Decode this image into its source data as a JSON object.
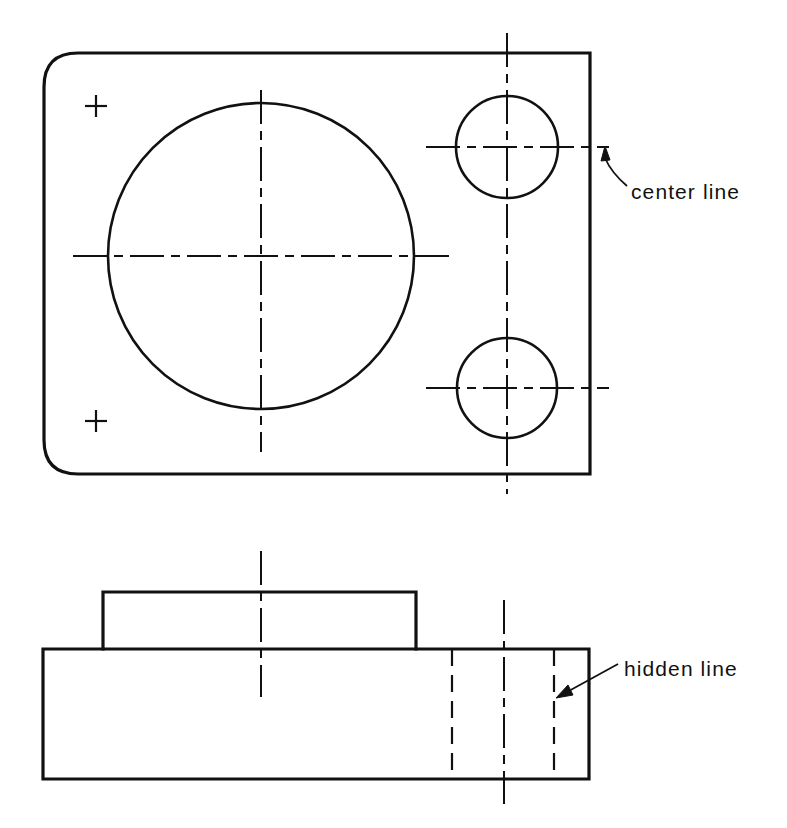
{
  "document": {
    "kind": "engineering-drawing",
    "background_color": "#ffffff",
    "line_color": "#111111"
  },
  "annotations": [
    {
      "id": "center-line",
      "label": "center  line",
      "text_x": 631,
      "text_y": 199,
      "leader": "M 627 186 C 620 180 611 172 605 158",
      "arrow_points": "605,146 601,161 610,160"
    },
    {
      "id": "hidden-line",
      "label": "hidden  line",
      "text_x": 624,
      "text_y": 676,
      "leader": "M 618 664 L 567 692",
      "arrow_points": "556,698 573,695 568,685"
    }
  ],
  "top_view": {
    "name": "top-view",
    "outline": {
      "left": 44,
      "top": 53,
      "right": 590,
      "bottom": 474,
      "corner_radius": 34,
      "rounded_corners": [
        "top-left",
        "bottom-left"
      ],
      "stroke_width": 3.2
    },
    "main_circle": {
      "cx": 261,
      "cy": 256,
      "r": 153,
      "stroke_width": 2.6
    },
    "holes": [
      {
        "id": "hole-top-right",
        "cx": 507,
        "cy": 147,
        "r": 51,
        "stroke_width": 2.6
      },
      {
        "id": "hole-bottom-right",
        "cx": 507,
        "cy": 388,
        "r": 50,
        "stroke_width": 2.6
      }
    ],
    "crosses": [
      {
        "id": "cross-top-left",
        "cx": 96,
        "cy": 106,
        "arm": 11
      },
      {
        "id": "cross-bottom-left",
        "cx": 96,
        "cy": 421,
        "arm": 11
      }
    ],
    "center_lines": [
      {
        "id": "main-circle-vertical",
        "x1": 261,
        "y1": 90,
        "x2": 261,
        "y2": 452
      },
      {
        "id": "main-circle-horizontal",
        "x1": 73,
        "y1": 256,
        "x2": 450,
        "y2": 256
      },
      {
        "id": "holes-vertical",
        "x1": 507,
        "y1": 33,
        "x2": 507,
        "y2": 494
      },
      {
        "id": "hole-top-right-horizontal",
        "x1": 426,
        "y1": 147,
        "x2": 609,
        "y2": 147
      },
      {
        "id": "hole-bottom-right-horizontal",
        "x1": 426,
        "y1": 388,
        "x2": 609,
        "y2": 388
      }
    ]
  },
  "front_view": {
    "name": "front-view",
    "base_block": {
      "left": 43,
      "top": 649,
      "right": 589,
      "bottom": 779,
      "stroke_width": 3.2
    },
    "raised_block": {
      "left": 103,
      "top": 592,
      "right": 416,
      "bottom": 649,
      "stroke_width": 3.2
    },
    "hidden_lines": [
      {
        "id": "hidden-line-left",
        "x": 452,
        "y1": 649,
        "y2": 779
      },
      {
        "id": "hidden-line-right",
        "x": 554,
        "y1": 649,
        "y2": 779
      }
    ],
    "center_lines": [
      {
        "id": "raised-block-vertical",
        "x1": 261,
        "y1": 551,
        "x2": 261,
        "y2": 697
      },
      {
        "id": "bore-vertical",
        "x1": 504,
        "y1": 600,
        "x2": 504,
        "y2": 804
      }
    ]
  },
  "line_styles": {
    "visible": {
      "dash": "none",
      "width": 3.2
    },
    "center": {
      "dash": "34 7 9 7",
      "width": 2.0
    },
    "hidden": {
      "dash": "17 9",
      "width": 2.2
    }
  }
}
